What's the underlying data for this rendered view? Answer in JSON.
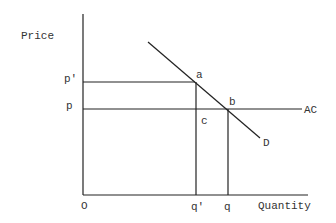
{
  "diagram": {
    "y_axis_label": "Price",
    "x_axis_label": "Quantity",
    "origin_label": "O",
    "price_labels": {
      "p_prime": "p'",
      "p": "p"
    },
    "quantity_labels": {
      "q_prime": "q'",
      "q": "q"
    },
    "point_labels": {
      "a": "a",
      "b": "b",
      "c": "c"
    },
    "curve_labels": {
      "demand": "D",
      "average_cost": "AC"
    }
  }
}
